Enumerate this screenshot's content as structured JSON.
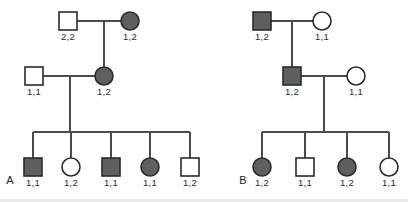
{
  "figure": {
    "width": 408,
    "height": 202,
    "background_color": "#fefefe",
    "line_color": "#4a4a4a",
    "symbol_stroke_color": "#2b2b2b",
    "affected_fill_color": "#5f5f5f",
    "unaffected_fill_color": "#ffffff"
  },
  "panels": [
    {
      "id": "A",
      "letter": "A",
      "letter_x": 10,
      "letter_y": 184,
      "individuals": [
        {
          "name": "a-i-1",
          "shape": "square",
          "sex": "male",
          "affected": false,
          "genotype": "2,2",
          "cx": 68,
          "cy": 21,
          "label_x": 68,
          "label_y": 40
        },
        {
          "name": "a-i-2",
          "shape": "circle",
          "sex": "female",
          "affected": true,
          "genotype": "1,2",
          "cx": 130,
          "cy": 21,
          "label_x": 130,
          "label_y": 40
        },
        {
          "name": "a-ii-1",
          "shape": "square",
          "sex": "male",
          "affected": false,
          "genotype": "1,1",
          "cx": 34,
          "cy": 76,
          "label_x": 34,
          "label_y": 95
        },
        {
          "name": "a-ii-2",
          "shape": "circle",
          "sex": "female",
          "affected": true,
          "genotype": "1,2",
          "cx": 104,
          "cy": 76,
          "label_x": 104,
          "label_y": 95
        },
        {
          "name": "a-iii-1",
          "shape": "square",
          "sex": "male",
          "affected": true,
          "genotype": "1,1",
          "cx": 33,
          "cy": 167,
          "label_x": 33,
          "label_y": 186
        },
        {
          "name": "a-iii-2",
          "shape": "circle",
          "sex": "female",
          "affected": false,
          "genotype": "1,2",
          "cx": 71,
          "cy": 167,
          "label_x": 71,
          "label_y": 186
        },
        {
          "name": "a-iii-3",
          "shape": "square",
          "sex": "male",
          "affected": true,
          "genotype": "1,1",
          "cx": 111,
          "cy": 167,
          "label_x": 111,
          "label_y": 186
        },
        {
          "name": "a-iii-4",
          "shape": "circle",
          "sex": "female",
          "affected": true,
          "genotype": "1,1",
          "cx": 150,
          "cy": 167,
          "label_x": 150,
          "label_y": 186
        },
        {
          "name": "a-iii-5",
          "shape": "square",
          "sex": "male",
          "affected": false,
          "genotype": "1,2",
          "cx": 190,
          "cy": 167,
          "label_x": 190,
          "label_y": 186
        }
      ],
      "connectors": [
        {
          "name": "a-gen1-mating-line",
          "type": "line",
          "x1": 77,
          "y1": 21,
          "x2": 121,
          "y2": 21
        },
        {
          "name": "a-gen1-descent-line",
          "type": "line",
          "x1": 104,
          "y1": 21,
          "x2": 104,
          "y2": 67
        },
        {
          "name": "a-gen2-mating-line",
          "type": "line",
          "x1": 43,
          "y1": 76,
          "x2": 95,
          "y2": 76
        },
        {
          "name": "a-gen2-descent-line",
          "type": "line",
          "x1": 70,
          "y1": 76,
          "x2": 70,
          "y2": 132
        },
        {
          "name": "a-sibship-line",
          "type": "line",
          "x1": 33,
          "y1": 132,
          "x2": 190,
          "y2": 132
        },
        {
          "name": "a-drop-child-1",
          "type": "line",
          "x1": 33,
          "y1": 132,
          "x2": 33,
          "y2": 158
        },
        {
          "name": "a-drop-child-2",
          "type": "line",
          "x1": 71,
          "y1": 132,
          "x2": 71,
          "y2": 158
        },
        {
          "name": "a-drop-child-3",
          "type": "line",
          "x1": 111,
          "y1": 132,
          "x2": 111,
          "y2": 158
        },
        {
          "name": "a-drop-child-4",
          "type": "line",
          "x1": 150,
          "y1": 132,
          "x2": 150,
          "y2": 158
        },
        {
          "name": "a-drop-child-5",
          "type": "line",
          "x1": 190,
          "y1": 132,
          "x2": 190,
          "y2": 158
        }
      ]
    },
    {
      "id": "B",
      "letter": "B",
      "letter_x": 243,
      "letter_y": 184,
      "individuals": [
        {
          "name": "b-i-1",
          "shape": "square",
          "sex": "male",
          "affected": true,
          "genotype": "1,2",
          "cx": 262,
          "cy": 21,
          "label_x": 262,
          "label_y": 40
        },
        {
          "name": "b-i-2",
          "shape": "circle",
          "sex": "female",
          "affected": false,
          "genotype": "1,1",
          "cx": 322,
          "cy": 21,
          "label_x": 322,
          "label_y": 40
        },
        {
          "name": "b-ii-1",
          "shape": "square",
          "sex": "male",
          "affected": true,
          "genotype": "1,2",
          "cx": 292,
          "cy": 76,
          "label_x": 292,
          "label_y": 95
        },
        {
          "name": "b-ii-2",
          "shape": "circle",
          "sex": "female",
          "affected": false,
          "genotype": "1,1",
          "cx": 356,
          "cy": 76,
          "label_x": 356,
          "label_y": 95
        },
        {
          "name": "b-iii-1",
          "shape": "circle",
          "sex": "female",
          "affected": true,
          "genotype": "1,2",
          "cx": 262,
          "cy": 167,
          "label_x": 262,
          "label_y": 186
        },
        {
          "name": "b-iii-2",
          "shape": "square",
          "sex": "male",
          "affected": false,
          "genotype": "1,1",
          "cx": 305,
          "cy": 167,
          "label_x": 305,
          "label_y": 186
        },
        {
          "name": "b-iii-3",
          "shape": "circle",
          "sex": "female",
          "affected": true,
          "genotype": "1,2",
          "cx": 347,
          "cy": 167,
          "label_x": 347,
          "label_y": 186
        },
        {
          "name": "b-iii-4",
          "shape": "circle",
          "sex": "female",
          "affected": false,
          "genotype": "1,1",
          "cx": 389,
          "cy": 167,
          "label_x": 389,
          "label_y": 186
        }
      ],
      "connectors": [
        {
          "name": "b-gen1-mating-line",
          "type": "line",
          "x1": 271,
          "y1": 21,
          "x2": 313,
          "y2": 21
        },
        {
          "name": "b-gen1-descent-line",
          "type": "line",
          "x1": 292,
          "y1": 21,
          "x2": 292,
          "y2": 67
        },
        {
          "name": "b-gen2-mating-line",
          "type": "line",
          "x1": 301,
          "y1": 76,
          "x2": 347,
          "y2": 76
        },
        {
          "name": "b-gen2-descent-line",
          "type": "line",
          "x1": 324,
          "y1": 76,
          "x2": 324,
          "y2": 132
        },
        {
          "name": "b-sibship-line",
          "type": "line",
          "x1": 262,
          "y1": 132,
          "x2": 389,
          "y2": 132
        },
        {
          "name": "b-drop-child-1",
          "type": "line",
          "x1": 262,
          "y1": 132,
          "x2": 262,
          "y2": 158
        },
        {
          "name": "b-drop-child-2",
          "type": "line",
          "x1": 305,
          "y1": 132,
          "x2": 305,
          "y2": 158
        },
        {
          "name": "b-drop-child-3",
          "type": "line",
          "x1": 347,
          "y1": 132,
          "x2": 347,
          "y2": 158
        },
        {
          "name": "b-drop-child-4",
          "type": "line",
          "x1": 389,
          "y1": 132,
          "x2": 389,
          "y2": 158
        }
      ]
    }
  ],
  "symbol_geometry": {
    "square_size": 18,
    "circle_radius": 9
  }
}
